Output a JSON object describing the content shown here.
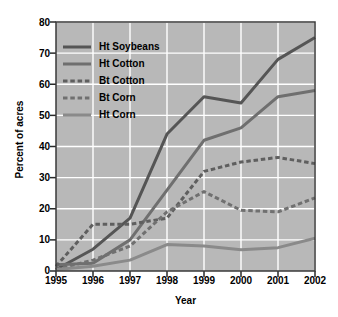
{
  "chart_data": {
    "type": "line",
    "title": "",
    "xlabel": "Year",
    "ylabel": "Percent of acres",
    "categories": [
      "1995",
      "1996",
      "1997",
      "1998",
      "1999",
      "2000",
      "2001",
      "2002"
    ],
    "x": [
      1995,
      1996,
      1997,
      1998,
      1999,
      2000,
      2001,
      2002
    ],
    "xlim": [
      1995,
      2002
    ],
    "ylim": [
      0,
      80
    ],
    "yticks": [
      0,
      10,
      20,
      30,
      40,
      50,
      60,
      70,
      80
    ],
    "xticks": [
      "1995",
      "1996",
      "1997",
      "1998",
      "1999",
      "2000",
      "2001",
      "2002"
    ],
    "grid": true,
    "grid_color": "#ffffff",
    "plot_background": "#b8b8b8",
    "legend_position": "upper-left",
    "series": [
      {
        "name": "Ht Soybeans",
        "values": [
          0.5,
          7,
          17,
          44,
          56,
          54,
          68,
          75
        ],
        "color": "#555555",
        "style": "solid",
        "width": 3
      },
      {
        "name": "Ht Cotton",
        "values": [
          2,
          2.5,
          10,
          26,
          42,
          46,
          56,
          58
        ],
        "color": "#6f6f6f",
        "style": "solid",
        "width": 3
      },
      {
        "name": "Bt Cotton",
        "values": [
          1.5,
          15,
          15,
          17,
          32,
          35,
          36.5,
          34.5
        ],
        "color": "#5f5f5f",
        "style": "dashed",
        "width": 3
      },
      {
        "name": "Bt Corn",
        "values": [
          0.5,
          3.5,
          8,
          19,
          25.5,
          19.5,
          19,
          23.5
        ],
        "color": "#707070",
        "style": "dashed",
        "width": 3
      },
      {
        "name": "Ht Corn",
        "values": [
          0.5,
          1.5,
          3.5,
          8.5,
          8,
          6.8,
          7.5,
          10.5
        ],
        "color": "#8a8a8a",
        "style": "solid",
        "width": 3
      }
    ]
  },
  "axes": {
    "y_title": "Percent of acres",
    "x_title": "Year",
    "y_tick_labels": [
      "80",
      "70",
      "60",
      "50",
      "40",
      "30",
      "20",
      "10",
      "0"
    ],
    "x_tick_labels": [
      "1995",
      "1996",
      "1997",
      "1998",
      "1999",
      "2000",
      "2001",
      "2002"
    ]
  },
  "legend": {
    "items": [
      {
        "label": "Ht Soybeans"
      },
      {
        "label": "Ht Cotton"
      },
      {
        "label": "Bt Cotton"
      },
      {
        "label": "Bt Corn"
      },
      {
        "label": "Ht Corn"
      }
    ]
  }
}
